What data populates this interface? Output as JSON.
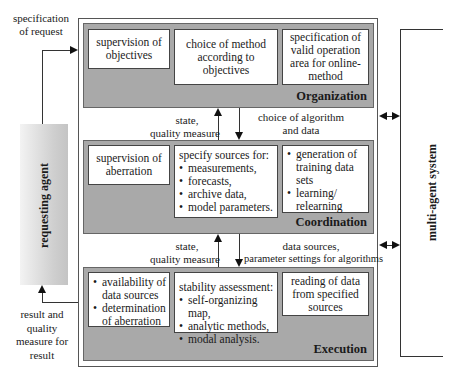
{
  "diagram": {
    "requesting_agent": {
      "label": "requesting agent"
    },
    "multi_agent_system": {
      "label": "multi-agent system"
    },
    "incoming_arrow": {
      "label": "specification of request",
      "lines": [
        "specification",
        "of request"
      ]
    },
    "outgoing_arrow": {
      "label": "result and quality measure for result",
      "lines": [
        "result and",
        "quality",
        "measure for",
        "result"
      ]
    },
    "layers": [
      {
        "name": "Organization",
        "boxes": [
          {
            "text": "supervision of objectives",
            "lines": [
              "supervision of",
              "objectives"
            ]
          },
          {
            "text": "choice of method according to objectives",
            "lines": [
              "choice of method",
              "according to",
              "objectives"
            ]
          },
          {
            "text": "specification of valid operation area for online-method",
            "lines": [
              "specification of",
              "valid operation",
              "area for online-",
              "method"
            ]
          }
        ]
      },
      {
        "name": "Coordination",
        "boxes": [
          {
            "text": "supervision of aberration",
            "lines": [
              "supervision of",
              "aberration"
            ]
          },
          {
            "heading": "specify sources for:",
            "bullets": [
              "measurements,",
              "forecasts,",
              "archive data,",
              "model parameters."
            ]
          },
          {
            "bullets": [
              "generation of training data sets",
              "learning/ relearning"
            ]
          }
        ]
      },
      {
        "name": "Execution",
        "boxes": [
          {
            "bullets": [
              "availability of data sources",
              "determination of aberration"
            ]
          },
          {
            "heading": "stability assessment:",
            "bullets": [
              "self-organizing map,",
              "analytic methods,",
              "modal analysis."
            ]
          },
          {
            "text": "reading of data from specified sources",
            "lines": [
              "reading of data",
              "from specified",
              "sources"
            ]
          }
        ]
      }
    ],
    "flows": [
      {
        "between": "Coordination->Organization",
        "direction": "up",
        "lines": [
          "state,",
          "quality measure"
        ]
      },
      {
        "between": "Organization->Coordination",
        "direction": "down",
        "lines": [
          "choice of algorithm",
          "and data"
        ]
      },
      {
        "between": "Execution->Coordination",
        "direction": "up",
        "lines": [
          "state,",
          "quality measure"
        ]
      },
      {
        "between": "Coordination->Execution",
        "direction": "down",
        "lines": [
          "data sources,",
          "parameter settings for algorithms"
        ]
      }
    ],
    "colors": {
      "panel_fill": "#a9a9a9",
      "box_fill": "#ffffff",
      "line": "#333333",
      "agent_gradient_start": "#f3f3f3",
      "agent_gradient_end": "#c4c4c4"
    }
  }
}
